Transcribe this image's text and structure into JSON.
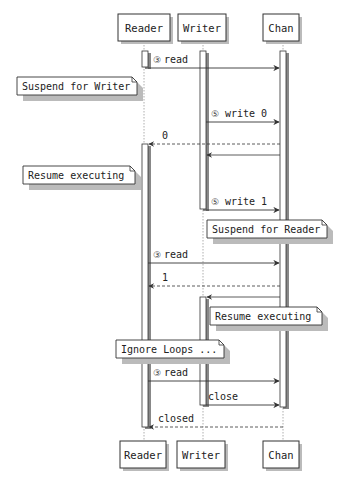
{
  "diagram": {
    "type": "sequence",
    "participants": [
      {
        "id": "reader",
        "label": "Reader"
      },
      {
        "id": "writer",
        "label": "Writer"
      },
      {
        "id": "chan",
        "label": "Chan"
      }
    ],
    "messages": [
      {
        "from": "reader",
        "to": "chan",
        "seq": "③",
        "label": "read",
        "style": "solid"
      },
      {
        "from": "writer",
        "to": "chan",
        "seq": "⑤",
        "label": "write 0",
        "style": "solid"
      },
      {
        "from": "chan",
        "to": "reader",
        "seq": "",
        "label": "0",
        "style": "dashed"
      },
      {
        "from": "chan",
        "to": "writer",
        "seq": "",
        "label": "",
        "style": "solid"
      },
      {
        "from": "writer",
        "to": "chan",
        "seq": "⑤",
        "label": "write 1",
        "style": "solid"
      },
      {
        "from": "reader",
        "to": "chan",
        "seq": "③",
        "label": "read",
        "style": "solid"
      },
      {
        "from": "chan",
        "to": "reader",
        "seq": "",
        "label": "1",
        "style": "dashed"
      },
      {
        "from": "chan",
        "to": "writer",
        "seq": "",
        "label": "",
        "style": "solid"
      },
      {
        "from": "reader",
        "to": "chan",
        "seq": "③",
        "label": "read",
        "style": "solid"
      },
      {
        "from": "writer",
        "to": "chan",
        "seq": "",
        "label": "close",
        "style": "solid"
      },
      {
        "from": "chan",
        "to": "reader",
        "seq": "",
        "label": "closed",
        "style": "dashed"
      }
    ],
    "notes": [
      {
        "label": "Suspend for Writer",
        "over": "reader"
      },
      {
        "label": "Resume executing",
        "over": "reader"
      },
      {
        "label": "Suspend for Reader",
        "over": "writer"
      },
      {
        "label": "Resume executing",
        "over": "writer"
      },
      {
        "label": "Ignore Loops ...",
        "over": "reader-writer"
      }
    ],
    "colors": {
      "line": "#333333",
      "lifeline": "#999999",
      "box_fill": "#ffffff",
      "shadow": "#bbbbbb"
    }
  }
}
